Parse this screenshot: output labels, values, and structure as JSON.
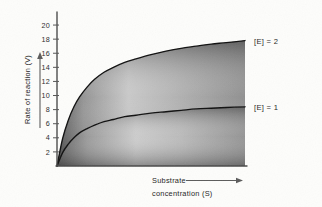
{
  "figure": {
    "background_color": "#fdfdfb",
    "ink_color": "#101010"
  },
  "chart_data": {
    "type": "line",
    "title": "",
    "subtitle": "",
    "xlabel_line1": "Substrate",
    "xlabel_line2": "concentration (S)",
    "ylabel": "Rate of reaction (V)",
    "xlim": [
      0,
      100
    ],
    "ylim": [
      0,
      21
    ],
    "grid": false,
    "x_ticks_shown": false,
    "y_ticks": [
      2,
      4,
      6,
      8,
      10,
      12,
      14,
      16,
      18,
      20
    ],
    "y_tick_labels": [
      "2",
      "4",
      "6",
      "8",
      "10",
      "12",
      "14",
      "16",
      "18",
      "20"
    ],
    "legend_position": "right-inline",
    "annotations": [
      {
        "text": "[E] = 2",
        "series": "E2",
        "placement": "right of top plateau"
      },
      {
        "text": "[E] = 1",
        "series": "E1",
        "placement": "right of lower plateau"
      }
    ],
    "series": [
      {
        "name": "E2",
        "label": "[E] = 2",
        "vmax": 19.6,
        "km": 12.0,
        "shaded": true,
        "x": [
          0,
          3,
          6,
          9,
          12,
          16,
          20,
          25,
          30,
          36,
          42,
          50,
          58,
          66,
          74,
          82,
          90,
          100
        ],
        "values": [
          0,
          3.9,
          6.5,
          8.4,
          9.8,
          11.2,
          12.3,
          13.3,
          14.0,
          14.7,
          15.2,
          15.8,
          16.3,
          16.7,
          17.0,
          17.3,
          17.5,
          17.8
        ]
      },
      {
        "name": "E1",
        "label": "[E] = 1",
        "vmax": 9.3,
        "km": 12.0,
        "shaded": true,
        "x": [
          0,
          3,
          6,
          9,
          12,
          16,
          20,
          25,
          30,
          36,
          42,
          50,
          58,
          66,
          74,
          82,
          90,
          100
        ],
        "values": [
          0,
          1.9,
          3.1,
          4.0,
          4.7,
          5.3,
          5.8,
          6.3,
          6.6,
          7.0,
          7.2,
          7.5,
          7.7,
          7.9,
          8.1,
          8.2,
          8.3,
          8.4
        ]
      }
    ]
  },
  "axes": {
    "y_axis_arrow": "up-arrow-icon",
    "x_axis_arrow": "right-arrow-icon"
  }
}
